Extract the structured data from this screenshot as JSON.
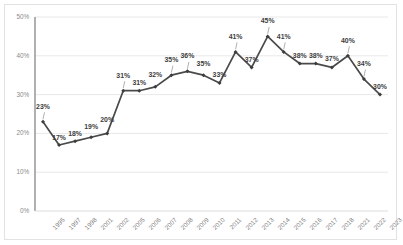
{
  "chart_data": {
    "type": "line",
    "title": "",
    "subtitle": "",
    "xlabel": "",
    "ylabel": "",
    "grid": true,
    "legend_position": "none",
    "ylim": [
      0,
      50
    ],
    "yticks": [
      "0%",
      "10%",
      "20%",
      "30%",
      "40%",
      "50%"
    ],
    "ytick_values": [
      0,
      10,
      20,
      30,
      40,
      50
    ],
    "categories": [
      "1995",
      "1997",
      "1998",
      "2001",
      "2002",
      "2005",
      "2006",
      "2007",
      "2008",
      "2009",
      "2010",
      "2011",
      "2012",
      "2013",
      "2014",
      "2015",
      "2016",
      "2017",
      "2018",
      "2021",
      "2022",
      "2023"
    ],
    "values": [
      23,
      17,
      18,
      19,
      20,
      31,
      31,
      32,
      35,
      36,
      35,
      33,
      41,
      37,
      45,
      41,
      38,
      38,
      37,
      40,
      34,
      30
    ],
    "point_labels": [
      "23%",
      "17%",
      "18%",
      "19%",
      "20%",
      "31%",
      "31%",
      "32%",
      "35%",
      "36%",
      "35%",
      "33%",
      "41%",
      "37%",
      "45%",
      "41%",
      "38%",
      "38%",
      "37%",
      "40%",
      "34%",
      "30%"
    ],
    "series": [
      {
        "name": "",
        "color": "#4a4a4a",
        "marker": "diamond",
        "values": [
          23,
          17,
          18,
          19,
          20,
          31,
          31,
          32,
          35,
          36,
          35,
          33,
          41,
          37,
          45,
          41,
          38,
          38,
          37,
          40,
          34,
          30
        ]
      }
    ],
    "colors": {
      "line": "#4a4a4a",
      "marker": "#3d3d3d",
      "grid": "#e8e8e8",
      "axis": "#8f8f8f",
      "label_text": "#3d3d3d",
      "tick_text": "#8a8a8a",
      "border": "#e2e2e2",
      "background": "#ffffff"
    }
  }
}
